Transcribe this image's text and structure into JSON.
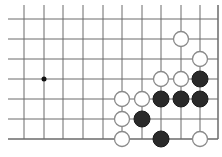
{
  "board": {
    "background": "#ffffff",
    "line_color": "#6a6a6a",
    "columns_x": [
      24,
      44,
      63,
      83,
      103,
      122,
      142,
      161,
      181,
      200
    ],
    "right_edge_x": 218,
    "rows_y": [
      19,
      39,
      59,
      79,
      99,
      119,
      139
    ],
    "top_extent_y": 5,
    "left_extent_x": 8,
    "bottom_edge_y": 139,
    "star_points": [
      {
        "col": 1,
        "row": 3
      }
    ],
    "stone_radius": 8,
    "stones": [
      {
        "color": "white",
        "col": 8,
        "row": 1
      },
      {
        "color": "white",
        "col": 9,
        "row": 2
      },
      {
        "color": "white",
        "col": 7,
        "row": 3
      },
      {
        "color": "white",
        "col": 8,
        "row": 3
      },
      {
        "color": "black",
        "col": 9,
        "row": 3
      },
      {
        "color": "white",
        "col": 5,
        "row": 4
      },
      {
        "color": "white",
        "col": 6,
        "row": 4
      },
      {
        "color": "black",
        "col": 7,
        "row": 4
      },
      {
        "color": "black",
        "col": 8,
        "row": 4
      },
      {
        "color": "black",
        "col": 9,
        "row": 4
      },
      {
        "color": "white",
        "col": 5,
        "row": 5
      },
      {
        "color": "black",
        "col": 6,
        "row": 5
      },
      {
        "color": "white",
        "col": 5,
        "row": 6
      },
      {
        "color": "black",
        "col": 7,
        "row": 6
      },
      {
        "color": "white",
        "col": 9,
        "row": 6
      }
    ],
    "stone_colors": {
      "black_fill": "#2a2a2a",
      "white_fill": "#ffffff",
      "white_stroke": "#8a8a8a"
    }
  }
}
